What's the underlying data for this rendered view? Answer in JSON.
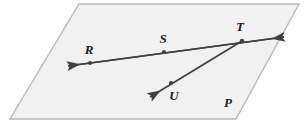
{
  "figure": {
    "background_color": "#ffffff",
    "plane": {
      "name": "plane-P",
      "label": "P",
      "fill_color": "#f1f1f1",
      "stroke_color": "#b9b9b9",
      "label_position": {
        "x": 228,
        "y": 107
      },
      "corners": [
        {
          "x": 79,
          "y": 4
        },
        {
          "x": 299,
          "y": 4
        },
        {
          "x": 236,
          "y": 119
        },
        {
          "x": 10,
          "y": 119
        }
      ]
    },
    "stroke_color": "#3f4044",
    "point_color": "#3f4044",
    "points": [
      {
        "name": "point-r",
        "label": "R",
        "x": 90,
        "y": 63,
        "label_x": 89,
        "label_y": 54
      },
      {
        "name": "point-s",
        "label": "S",
        "x": 164,
        "y": 52,
        "label_x": 163,
        "label_y": 43
      },
      {
        "name": "point-t",
        "label": "T",
        "x": 242,
        "y": 41,
        "label_x": 240,
        "label_y": 31
      },
      {
        "name": "point-u",
        "label": "U",
        "x": 171,
        "y": 83,
        "label_x": 174,
        "label_y": 100
      }
    ],
    "lines": [
      {
        "name": "line-rst",
        "description": "double-headed line through R, S and T",
        "from": {
          "x": 68,
          "y": 66
        },
        "to": {
          "x": 284,
          "y": 37
        },
        "arrow_start": true,
        "arrow_end": true
      },
      {
        "name": "ray-tu",
        "description": "ray from T through U",
        "from": {
          "x": 242,
          "y": 41
        },
        "to": {
          "x": 150,
          "y": 97
        },
        "arrow_start": false,
        "arrow_end": true
      }
    ]
  }
}
